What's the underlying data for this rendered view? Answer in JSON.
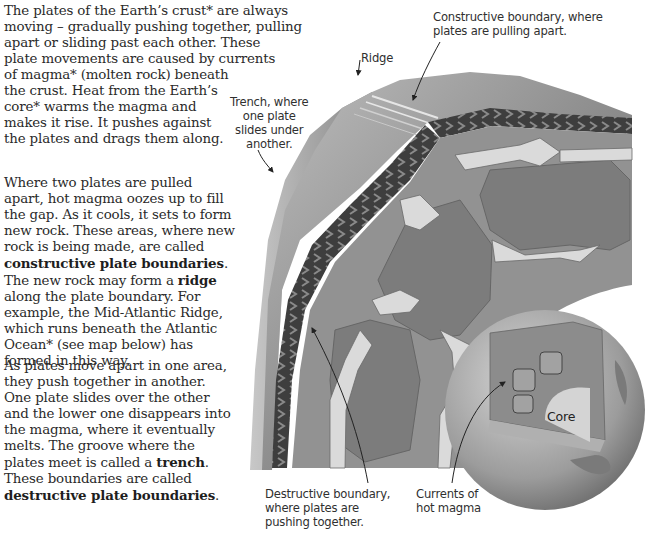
{
  "paragraphs": [
    {
      "id": "para1",
      "segments": [
        {
          "text": "The plates of the Earth’s crust* are always\nmoving – gradually pushing together, pulling\napart or sliding past each other. These\nplate movements are caused by currents\nof magma* (molten rock) beneath\nthe crust. Heat from the Earth’s\ncore* warms the magma and\nmakes it rise. It pushes against\nthe plates and drags them along.",
          "bold": false
        }
      ]
    },
    {
      "id": "para2",
      "segments": [
        {
          "text": "Where two plates are pulled\napart, hot magma oozes up to fill\nthe gap. As it cools, it sets to form\nnew rock. These areas, where new\nrock is being made, are called\n",
          "bold": false
        },
        {
          "text": "constructive plate boundaries",
          "bold": true
        },
        {
          "text": ".\nThe new rock may form a ",
          "bold": false
        },
        {
          "text": "ridge",
          "bold": true
        },
        {
          "text": "\nalong the plate boundary. For\nexample, the Mid-Atlantic Ridge,\nwhich runs beneath the Atlantic\nOcean* (see map below) has\nformed in this way.",
          "bold": false
        }
      ]
    },
    {
      "id": "para3",
      "segments": [
        {
          "text": "As plates move apart in one area,\nthey push together in another.\nOne plate slides over the other\nand the lower one disappears into\nthe magma, where it eventually\nmelts. The groove where the\nplates meet is called a ",
          "bold": false
        },
        {
          "text": "trench",
          "bold": true
        },
        {
          "text": ".\nThese boundaries are called\n",
          "bold": false
        },
        {
          "text": "destructive plate boundaries",
          "bold": true
        },
        {
          "text": ".",
          "bold": false
        }
      ]
    }
  ],
  "diagram": {
    "labels": {
      "constructive": "Constructive boundary, where\nplates are pulling apart.",
      "ridge": "Ridge",
      "trench": "Trench, where\none plate\nslides under\nanother.",
      "destructive": "Destructive boundary,\nwhere plates are\npushing together.",
      "currents": "Currents of\nhot magma",
      "core": "Core"
    },
    "colors": {
      "crust_dark": "#4a4a4a",
      "crust_top": "#8a8a8a",
      "mantle": "#8f8f8f",
      "mantle_cell": "#7b7b7b",
      "current_arrow": "#d8d8d8",
      "globe": "#a8a8a8",
      "core": "#d2d2d2"
    }
  }
}
